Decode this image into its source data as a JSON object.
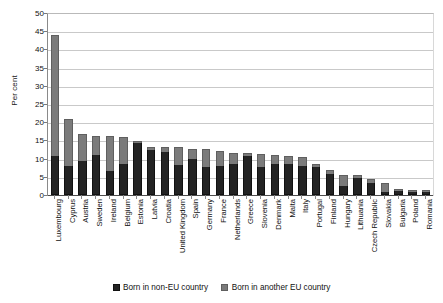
{
  "chart_data": {
    "type": "bar",
    "subtype": "stacked-column",
    "title": "",
    "xlabel": "",
    "ylabel": "Per cent",
    "ylim": [
      0,
      50
    ],
    "yticks": [
      0,
      5,
      10,
      15,
      20,
      25,
      30,
      35,
      40,
      45,
      50
    ],
    "grid": true,
    "legend_position": "bottom",
    "colors": {
      "born_in_non_eu_country": "#232323",
      "born_in_another_eu_country": "#7b7b7b"
    },
    "categories": [
      "Luxembourg",
      "Cyprus",
      "Austria",
      "Sweden",
      "Ireland",
      "Belgium",
      "Estonia",
      "Latvia",
      "Croatia",
      "United Kingdom",
      "Spain",
      "Germany",
      "France",
      "Netherlands",
      "Greece",
      "Slovenia",
      "Denmark",
      "Malta",
      "Italy",
      "Portugal",
      "Finland",
      "Hungary",
      "Lithuania",
      "Czech Republic",
      "Slovakia",
      "Bulgaria",
      "Poland",
      "Romania"
    ],
    "series": [
      {
        "name": "Born in non-EU country",
        "color": "#232323",
        "values": [
          10.8,
          8.0,
          9.3,
          11.0,
          6.7,
          8.5,
          14.3,
          12.3,
          11.8,
          8.2,
          10.0,
          7.8,
          8.0,
          8.6,
          10.6,
          7.8,
          8.5,
          8.5,
          8.0,
          7.8,
          5.8,
          2.5,
          4.8,
          3.4,
          0.9,
          1.0,
          0.9,
          0.7
        ]
      },
      {
        "name": "Born in another EU country",
        "color": "#7b7b7b",
        "values": [
          33.2,
          12.9,
          7.6,
          5.3,
          9.6,
          7.5,
          0.4,
          1.0,
          1.5,
          5.1,
          2.7,
          4.9,
          4.0,
          3.0,
          0.9,
          3.5,
          2.5,
          2.3,
          2.5,
          0.8,
          1.0,
          3.0,
          0.7,
          0.9,
          2.4,
          0.3,
          0.4,
          0.3
        ]
      }
    ],
    "totals": [
      44.0,
      20.9,
      16.9,
      16.3,
      16.3,
      16.0,
      14.7,
      13.3,
      13.3,
      13.3,
      12.7,
      12.7,
      12.0,
      11.6,
      11.5,
      11.3,
      11.0,
      10.8,
      10.5,
      8.6,
      6.8,
      5.5,
      5.5,
      4.3,
      3.3,
      1.3,
      1.3,
      1.0
    ]
  },
  "legend": {
    "items": [
      {
        "label": "Born in non-EU country"
      },
      {
        "label": "Born in another EU country"
      }
    ]
  }
}
